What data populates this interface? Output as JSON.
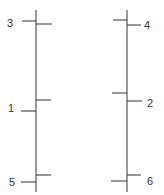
{
  "diagram": {
    "left_line": {
      "x": 36,
      "y1": 10,
      "y2": 192,
      "ticks": [
        {
          "side": "left",
          "y": 21,
          "length": 14
        },
        {
          "side": "right",
          "y": 24,
          "length": 16
        },
        {
          "side": "right",
          "y": 100,
          "length": 15
        },
        {
          "side": "left",
          "y": 111,
          "length": 15
        },
        {
          "side": "right",
          "y": 175,
          "length": 15
        },
        {
          "side": "left",
          "y": 182,
          "length": 15
        }
      ],
      "labels": [
        {
          "text": "3",
          "x": 7,
          "y": 27
        },
        {
          "text": "1",
          "x": 8,
          "y": 112
        },
        {
          "text": "5",
          "x": 9,
          "y": 186
        }
      ]
    },
    "right_line": {
      "x": 127,
      "y1": 10,
      "y2": 192,
      "ticks": [
        {
          "side": "left",
          "y": 20,
          "length": 14
        },
        {
          "side": "right",
          "y": 25,
          "length": 14
        },
        {
          "side": "left",
          "y": 93,
          "length": 15
        },
        {
          "side": "right",
          "y": 101,
          "length": 15
        },
        {
          "side": "right",
          "y": 175,
          "length": 14
        },
        {
          "side": "left",
          "y": 181,
          "length": 16
        }
      ],
      "labels": [
        {
          "text": "4",
          "x": 144,
          "y": 29
        },
        {
          "text": "2",
          "x": 147,
          "y": 107
        },
        {
          "text": "6",
          "x": 147,
          "y": 185
        }
      ]
    },
    "color": "#333333"
  }
}
